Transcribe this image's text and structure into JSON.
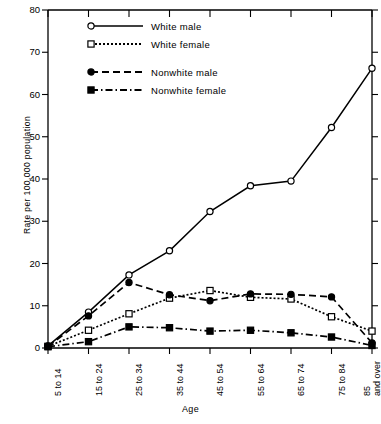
{
  "chart_data": {
    "type": "line",
    "title": "",
    "xlabel": "Age",
    "ylabel": "Rate per 100,000 population",
    "categories": [
      "5 to 14",
      "15 to 24",
      "25 to 34",
      "35 to 44",
      "45 to 54",
      "55 to 64",
      "65 to 74",
      "75 to 84",
      "85 and over"
    ],
    "ylim": [
      0,
      80
    ],
    "yticks": [
      0,
      10,
      20,
      30,
      40,
      50,
      60,
      70,
      80
    ],
    "grid": false,
    "legend_position": "top-center",
    "series": [
      {
        "name": "White male",
        "marker": "open-circle",
        "line": "solid",
        "values": [
          0.5,
          8.5,
          17.3,
          23.0,
          32.3,
          38.4,
          39.5,
          52.2,
          66.2
        ]
      },
      {
        "name": "White female",
        "marker": "open-square",
        "line": "dotted",
        "values": [
          0.4,
          4.2,
          8.1,
          11.8,
          13.6,
          12.0,
          11.6,
          7.4,
          4.0
        ]
      },
      {
        "name": "Nonwhite male",
        "marker": "filled-circle",
        "line": "dashed",
        "values": [
          0.4,
          7.6,
          15.5,
          12.6,
          11.2,
          12.8,
          12.7,
          12.1,
          1.2
        ]
      },
      {
        "name": "Nonwhite female",
        "marker": "filled-square",
        "line": "dash-dot",
        "values": [
          0.3,
          1.5,
          5.0,
          4.8,
          4.0,
          4.2,
          3.6,
          2.6,
          0.6
        ]
      }
    ]
  },
  "y_tick_labels": [
    "0",
    "10",
    "20",
    "30",
    "40",
    "50",
    "60",
    "70",
    "80"
  ],
  "x_tick_labels": [
    {
      "line1": "5 to 14",
      "line2": ""
    },
    {
      "line1": "15 to 24",
      "line2": ""
    },
    {
      "line1": "25 to 34",
      "line2": ""
    },
    {
      "line1": "35 to 44",
      "line2": ""
    },
    {
      "line1": "45 to 54",
      "line2": ""
    },
    {
      "line1": "55 to 64",
      "line2": ""
    },
    {
      "line1": "65 to 74",
      "line2": ""
    },
    {
      "line1": "75 to 84",
      "line2": ""
    },
    {
      "line1": "85",
      "line2": "and over"
    }
  ],
  "axis_titles": {
    "x": "Age",
    "y": "Rate per 100,000 population"
  },
  "legend": {
    "entries": [
      {
        "label": "White male",
        "marker": "open-circle",
        "line": "solid"
      },
      {
        "label": "White female",
        "marker": "open-square",
        "line": "dotted"
      },
      {
        "label": "Nonwhite male",
        "marker": "filled-circle",
        "line": "dashed"
      },
      {
        "label": "Nonwhite female",
        "marker": "filled-square",
        "line": "dash-dot"
      }
    ]
  },
  "colors": {
    "ink": "#000000",
    "background": "#ffffff"
  }
}
